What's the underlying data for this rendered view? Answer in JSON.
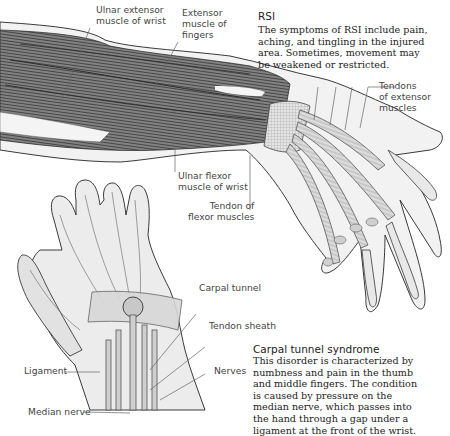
{
  "rsi_caption": {
    "title": "RSI",
    "body": "The symptoms of RSI include pain,\naching, and tingling in the injured\narea. Sometimes, movement may\nbe weakened or restricted."
  },
  "carpal_caption": {
    "title": "Carpal tunnel syndrome",
    "body": "This disorder is characterized by\nnumbness and pain in the thumb\nand middle fingers. The condition\nis caused by pressure on the\nmedian nerve, which passes into\nthe hand through a gap under a\nligament at the front of the wrist."
  },
  "arm_labels": {
    "ulnar_extensor": "Ulnar extensor\nmuscle of wrist",
    "extensor_fingers": "Extensor\nmuscle of\nfingers",
    "tendons_extensor": "Tendons\nof extensor\nmuscles",
    "ulnar_flexor": "Ulnar flexor\nmuscle of wrist",
    "tendon_flexor": "Tendon of\nflexor muscles"
  },
  "hand_labels": {
    "carpal_tunnel": "Carpal tunnel",
    "tendon_sheath": "Tendon sheath",
    "ligament": "Ligament",
    "nerves": "Nerves",
    "median_nerve": "Median nerve"
  },
  "colors": {
    "muscle_dark": "#5a5a5a",
    "muscle_light": "#9a9a9a",
    "skin": "#e6e6e6",
    "outline": "#3a3a3a",
    "leader_line": "#666666"
  }
}
